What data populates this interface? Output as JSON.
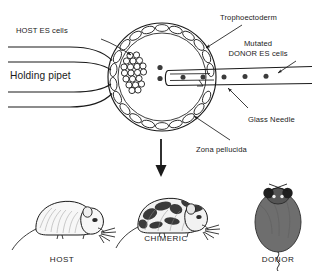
{
  "figure": {
    "background_color": "#ffffff",
    "ink_color": "#1a1a1a",
    "width": 316,
    "height": 274
  },
  "labels": {
    "host_es_cells": "HOST ES cells",
    "holding_pipet": "Holding pipet",
    "trophoectoderm": "Trophoectoderm",
    "mutated_donor_line1": "Mutated",
    "mutated_donor_line2": "DONOR ES cells",
    "glass_needle": "Glass Needle",
    "zona_pellucida": "Zona pellucida"
  },
  "mice": [
    {
      "id": "host",
      "label": "HOST",
      "coat": "white",
      "coat_color": "#f2f2f2",
      "view": "side",
      "patches": 0
    },
    {
      "id": "chimeric",
      "label": "CHIMERIC",
      "coat": "patched",
      "coat_color": "#ececec",
      "patch_color": "#3a3a3a",
      "view": "side",
      "patches": 6
    },
    {
      "id": "donor",
      "label": "DONOR",
      "coat": "dark",
      "coat_color": "#6e6e6e",
      "view": "top",
      "patches": 0
    }
  ],
  "blastocyst": {
    "center_x": 162,
    "center_y": 77,
    "outer_radius": 54,
    "inner_radius": 44,
    "trophoectoderm_cell_count": 22,
    "icm_cell_count": 21,
    "free_cell_count": 2,
    "needle_cell_count": 5
  },
  "icons": {
    "down_arrow": "down-arrow-icon",
    "pointer_arrow": "arrow-icon"
  }
}
